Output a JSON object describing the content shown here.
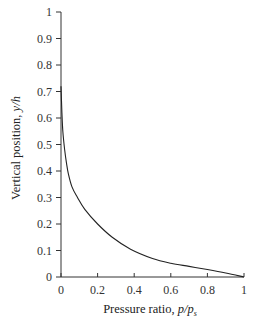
{
  "chart_data": {
    "type": "line",
    "title": "",
    "xlabel": "Pressure ratio, p/p_s",
    "xlabel_parts": {
      "prefix": "Pressure ratio, ",
      "var": "p/p",
      "sub": "s"
    },
    "ylabel": "Vertical position, y/h",
    "ylabel_parts": {
      "prefix": "Vertical position, ",
      "var": "y/h"
    },
    "xlim": [
      0,
      1
    ],
    "ylim": [
      0,
      1
    ],
    "xticks": [
      "0",
      "0.2",
      "0.4",
      "0.6",
      "0.8",
      "1"
    ],
    "yticks": [
      "0",
      "0.1",
      "0.2",
      "0.3",
      "0.4",
      "0.5",
      "0.6",
      "0.7",
      "0.8",
      "0.9",
      "1"
    ],
    "grid": false,
    "legend": null,
    "series": [
      {
        "name": "pressure distribution",
        "color": "#222222",
        "x": [
          0.0,
          0.005,
          0.01,
          0.02,
          0.03,
          0.04,
          0.06,
          0.09,
          0.13,
          0.2,
          0.28,
          0.38,
          0.5,
          0.6,
          0.7,
          0.8,
          0.9,
          1.0
        ],
        "y": [
          0.72,
          0.62,
          0.55,
          0.48,
          0.43,
          0.39,
          0.34,
          0.3,
          0.255,
          0.2,
          0.15,
          0.105,
          0.07,
          0.052,
          0.04,
          0.028,
          0.015,
          0.0
        ]
      }
    ]
  }
}
